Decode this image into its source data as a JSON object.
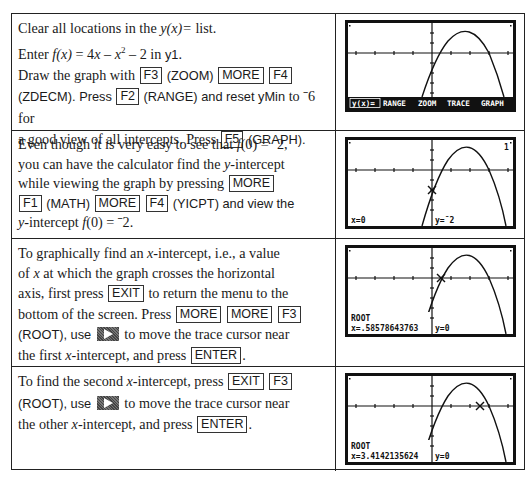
{
  "rows": [
    {
      "lines": {
        "l1a": "Clear all locations in the ",
        "l1b": "y(x)=",
        "l1c": " list.",
        "l2a": "Enter ",
        "l2b": "f(x)",
        "l2c": " = 4",
        "l2d": "x",
        "l2e": " – ",
        "l2f": "x",
        "l2g": "2",
        "l2h": " – 2  in ",
        "l2i": "y1",
        "l2j": ".",
        "l3a": "Draw the graph with ",
        "l3b": " (ZOOM) ",
        "l4a": "(ZDECM).  Press ",
        "l4b": " (RANGE) and reset ",
        "l4c": "yMin",
        "l4d": " to ˉ6 for",
        "l5a": "a good view of all intercepts.  Press ",
        "l5b": " (GRAPH)."
      },
      "keys": [
        "F3",
        "MORE",
        "F4",
        "F2",
        "F5"
      ],
      "screen": {
        "menu": [
          "y(x)=",
          "RANGE",
          "ZOOM",
          "TRACE",
          "GRAPH"
        ],
        "menu_more_indicator": "▸"
      }
    },
    {
      "lines": {
        "l1a": "Even though it is very easy to see that ",
        "l1b": "f",
        "l1c": "(0) = ˉ2,",
        "l2a": "you can have the calculator find the ",
        "l2b": "y",
        "l2c": "-intercept",
        "l3a": "while viewing the graph by pressing ",
        "l4a": " (MATH) ",
        "l4b": " (YICPT) and view the",
        "l5a": "y",
        "l5b": "-intercept ",
        "l5c": "f",
        "l5d": "(0) = ˉ2."
      },
      "keys": [
        "MORE",
        "F1",
        "MORE",
        "F4"
      ],
      "screen": {
        "corner_label": "1",
        "x_readout": "x=0",
        "y_readout": "y=ˉ2"
      }
    },
    {
      "lines": {
        "l1a": "To graphically find an ",
        "l1b": "x",
        "l1c": "-intercept, i.e., a value",
        "l2a": "of ",
        "l2b": "x",
        "l2c": " at which the graph crosses the horizontal",
        "l3a": "axis, first press ",
        "l3b": " to return the menu to the",
        "l4a": "bottom of the screen.  Press ",
        "l5a": "(ROOT), use ",
        "l5b": " to move the trace cursor near",
        "l6a": "the first ",
        "l6b": "x",
        "l6c": "-intercept, and press ",
        "l6d": "."
      },
      "keys": [
        "EXIT",
        "MORE",
        "MORE",
        "F3",
        "ENTER"
      ],
      "screen": {
        "label": "ROOT",
        "x_readout": "x=.58578643763",
        "y_readout": "y=0"
      }
    },
    {
      "lines": {
        "l1a": "To find the second ",
        "l1b": "x",
        "l1c": "-intercept, press ",
        "l2a": "(ROOT), use ",
        "l2b": " to move the trace cursor near",
        "l3a": "the other ",
        "l3b": "x",
        "l3c": "-intercept, and press ",
        "l3d": "."
      },
      "keys": [
        "EXIT",
        "F3",
        "ENTER"
      ],
      "screen": {
        "label": "ROOT",
        "x_readout": "x=3.4142135624",
        "y_readout": "y=0"
      }
    }
  ],
  "icons": {
    "right_arrow_key": "right-arrow-key-icon"
  }
}
